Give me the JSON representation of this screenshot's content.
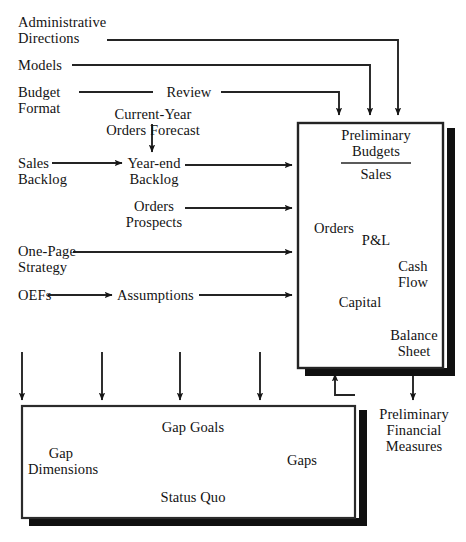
{
  "diagram": {
    "title_fragment": "",
    "inputs": [
      {
        "id": "administrative-directions",
        "label": "Administrative\nDirections"
      },
      {
        "id": "models",
        "label": "Models"
      },
      {
        "id": "budget-format",
        "label": "Budget\nFormat"
      },
      {
        "id": "review",
        "label": "Review"
      },
      {
        "id": "current-year-orders-forecast",
        "label": "Current-Year\nOrders Forecast"
      },
      {
        "id": "sales-backlog",
        "label": "Sales\nBacklog"
      },
      {
        "id": "year-end-backlog",
        "label": "Year-end\nBacklog"
      },
      {
        "id": "orders-prospects",
        "label": "Orders\nProspects"
      },
      {
        "id": "one-page-strategy",
        "label": "One-Page\nStrategy"
      },
      {
        "id": "oefs",
        "label": "OEFs"
      },
      {
        "id": "assumptions",
        "label": "Assumptions"
      }
    ],
    "preliminary_budgets_box": {
      "heading": "Preliminary\nBudgets",
      "nodes": [
        {
          "id": "sales",
          "label": "Sales"
        },
        {
          "id": "orders",
          "label": "Orders"
        },
        {
          "id": "pandl",
          "label": "P&L"
        },
        {
          "id": "cash-flow",
          "label": "Cash\nFlow"
        },
        {
          "id": "capital",
          "label": "Capital"
        },
        {
          "id": "balance-sheet",
          "label": "Balance\nSheet"
        }
      ]
    },
    "gap_analysis_box": {
      "nodes": [
        {
          "id": "gap-dimensions",
          "label": "Gap\nDimensions"
        },
        {
          "id": "gap-goals",
          "label": "Gap Goals"
        },
        {
          "id": "status-quo",
          "label": "Status Quo"
        },
        {
          "id": "gaps",
          "label": "Gaps"
        }
      ]
    },
    "output": {
      "id": "preliminary-financial-measures",
      "label": "Preliminary\nFinancial\nMeasures"
    },
    "colors": {
      "ink": "#141414",
      "line": "#2b2b2b",
      "shadow": "#101010",
      "paper": "#ffffff"
    }
  }
}
